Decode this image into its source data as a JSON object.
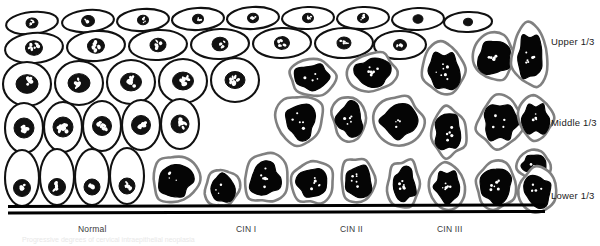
{
  "figure": {
    "width": 600,
    "height": 246,
    "background": "#ffffff"
  },
  "zone_labels": [
    {
      "name": "upper-third",
      "text": "Upper 1/3",
      "x": 551,
      "y": 36
    },
    {
      "name": "middle-third",
      "text": "Middle 1/3",
      "x": 551,
      "y": 117
    },
    {
      "name": "lower-third",
      "text": "Lower 1/3",
      "x": 551,
      "y": 190
    }
  ],
  "stage_labels": [
    {
      "name": "stage-normal",
      "text": "Normal",
      "x": 78,
      "y": 224
    },
    {
      "name": "stage-cin-1",
      "text": "CIN I",
      "x": 236,
      "y": 224
    },
    {
      "name": "stage-cin-2",
      "text": "CIN II",
      "x": 340,
      "y": 224
    },
    {
      "name": "stage-cin-3",
      "text": "CIN III",
      "x": 437,
      "y": 224
    }
  ],
  "caption": {
    "text": "Progressive degrees of cervical intraepithelial neoplasia",
    "visible": "faint"
  },
  "colors": {
    "outline_normal": "#111111",
    "outline_abnormal": "#808080",
    "nucleus_normal": "#111111",
    "nucleus_abnormal": "#050505",
    "cytoplasm": "#ffffff",
    "basement_membrane": "#000000",
    "label_text": "#1b1b1b",
    "stage_text": "#3a3a3a"
  },
  "basement_membrane": {
    "name": "basement-membrane",
    "lines": [
      {
        "x1": 8,
        "y1": 206.5,
        "x2": 545,
        "y2": 205.0,
        "width": 3.0
      },
      {
        "x1": 8,
        "y1": 213.0,
        "x2": 545,
        "y2": 211.5,
        "width": 3.0
      }
    ]
  },
  "chart_data": {
    "type": "diagram",
    "x_progression": [
      "Normal",
      "CIN I",
      "CIN II",
      "CIN III"
    ],
    "y_zones": [
      "Upper 1/3",
      "Middle 1/3",
      "Lower 1/3"
    ],
    "dysplasia_involvement": [
      {
        "stage": "Normal",
        "lower_third": "normal",
        "middle_third": "normal",
        "upper_third": "normal"
      },
      {
        "stage": "CIN I",
        "lower_third": "abnormal",
        "middle_third": "normal",
        "upper_third": "normal"
      },
      {
        "stage": "CIN II",
        "lower_third": "abnormal",
        "middle_third": "abnormal",
        "upper_third": "normal"
      },
      {
        "stage": "CIN III",
        "lower_third": "abnormal",
        "middle_third": "abnormal",
        "upper_third": "abnormal"
      }
    ]
  },
  "normal_cells": {
    "row_top": [
      {
        "cx": 32,
        "cy": 23,
        "rx": 26,
        "ry": 11,
        "nx": 32,
        "ny": 23,
        "nr": 6.0,
        "rot": -6
      },
      {
        "cx": 88,
        "cy": 21,
        "rx": 26,
        "ry": 11,
        "nx": 88,
        "ny": 21,
        "nr": 6.5,
        "rot": -5
      },
      {
        "cx": 143,
        "cy": 20,
        "rx": 26,
        "ry": 11,
        "nx": 143,
        "ny": 20,
        "nr": 5.5,
        "rot": -4
      },
      {
        "cx": 198,
        "cy": 19,
        "rx": 26,
        "ry": 11,
        "nx": 198,
        "ny": 19,
        "nr": 5.5,
        "rot": -3
      },
      {
        "cx": 253,
        "cy": 18,
        "rx": 26,
        "ry": 11,
        "nx": 253,
        "ny": 18,
        "nr": 5.5,
        "rot": -3
      },
      {
        "cx": 308,
        "cy": 18,
        "rx": 26,
        "ry": 11,
        "nx": 308,
        "ny": 18,
        "nr": 5.5,
        "rot": -2
      },
      {
        "cx": 363,
        "cy": 18,
        "rx": 26,
        "ry": 11,
        "nx": 363,
        "ny": 18,
        "nr": 5.5,
        "rot": -2
      },
      {
        "cx": 418,
        "cy": 19,
        "rx": 26,
        "ry": 11,
        "nx": 418,
        "ny": 19,
        "nr": 5.0,
        "rot": -2
      },
      {
        "cx": 468,
        "cy": 22,
        "rx": 24,
        "ry": 10,
        "nx": 468,
        "ny": 22,
        "nr": 4.5,
        "rot": -2
      }
    ],
    "row_second": [
      {
        "cx": 34,
        "cy": 48,
        "rx": 29,
        "ry": 15,
        "nx": 34,
        "ny": 48,
        "nr": 8.5,
        "rot": -5
      },
      {
        "cx": 96,
        "cy": 46,
        "rx": 29,
        "ry": 15,
        "nx": 96,
        "ny": 46,
        "nr": 8.5,
        "rot": -4
      },
      {
        "cx": 158,
        "cy": 45,
        "rx": 29,
        "ry": 15,
        "nx": 158,
        "ny": 45,
        "nr": 8.0,
        "rot": -3
      },
      {
        "cx": 220,
        "cy": 44,
        "rx": 29,
        "ry": 15,
        "nx": 220,
        "ny": 44,
        "nr": 8.0,
        "rot": -2
      },
      {
        "cx": 282,
        "cy": 43,
        "rx": 29,
        "ry": 15,
        "nx": 282,
        "ny": 43,
        "nr": 7.5,
        "rot": -2
      },
      {
        "cx": 344,
        "cy": 43,
        "rx": 29,
        "ry": 15,
        "nx": 344,
        "ny": 43,
        "nr": 7.0,
        "rot": -1
      },
      {
        "cx": 400,
        "cy": 45,
        "rx": 26,
        "ry": 14,
        "nx": 400,
        "ny": 45,
        "nr": 6.5,
        "rot": -1
      }
    ],
    "row_third": [
      {
        "cx": 27,
        "cy": 84,
        "rx": 24,
        "ry": 22,
        "nx": 27,
        "ny": 84,
        "nr": 11.0,
        "rot": 0
      },
      {
        "cx": 79,
        "cy": 83,
        "rx": 24,
        "ry": 22,
        "nx": 79,
        "ny": 83,
        "nr": 11.0,
        "rot": 0
      },
      {
        "cx": 131,
        "cy": 82,
        "rx": 24,
        "ry": 22,
        "nx": 131,
        "ny": 82,
        "nr": 10.5,
        "rot": 0
      },
      {
        "cx": 183,
        "cy": 81,
        "rx": 24,
        "ry": 22,
        "nx": 183,
        "ny": 81,
        "nr": 10.5,
        "rot": 0
      },
      {
        "cx": 235,
        "cy": 80,
        "rx": 24,
        "ry": 22,
        "nx": 235,
        "ny": 80,
        "nr": 10.0,
        "rot": 0
      }
    ],
    "row_fourth": [
      {
        "cx": 24,
        "cy": 128,
        "rx": 19,
        "ry": 25,
        "nx": 24,
        "ny": 128,
        "nr": 10.0,
        "rot": 0
      },
      {
        "cx": 63,
        "cy": 127,
        "rx": 19,
        "ry": 25,
        "nx": 63,
        "ny": 127,
        "nr": 10.0,
        "rot": 0
      },
      {
        "cx": 102,
        "cy": 126,
        "rx": 19,
        "ry": 25,
        "nx": 102,
        "ny": 126,
        "nr": 9.5,
        "rot": 0
      },
      {
        "cx": 141,
        "cy": 125,
        "rx": 19,
        "ry": 25,
        "nx": 141,
        "ny": 125,
        "nr": 9.5,
        "rot": 0
      },
      {
        "cx": 180,
        "cy": 124,
        "rx": 19,
        "ry": 25,
        "nx": 180,
        "ny": 124,
        "nr": 9.0,
        "rot": 0
      }
    ],
    "row_basal": [
      {
        "cx": 22,
        "cy": 178,
        "rx": 17,
        "ry": 28,
        "nx": 22,
        "ny": 188,
        "nr": 8.5,
        "rot": 0
      },
      {
        "cx": 57,
        "cy": 177,
        "rx": 17,
        "ry": 28,
        "nx": 57,
        "ny": 187,
        "nr": 8.5,
        "rot": 0
      },
      {
        "cx": 92,
        "cy": 177,
        "rx": 17,
        "ry": 28,
        "nx": 92,
        "ny": 187,
        "nr": 8.0,
        "rot": 0
      },
      {
        "cx": 127,
        "cy": 176,
        "rx": 17,
        "ry": 28,
        "nx": 127,
        "ny": 186,
        "nr": 8.0,
        "rot": 0
      }
    ]
  },
  "abnormal_cells": {
    "cin1_lower": [
      {
        "name": "dysplastic-cell",
        "cx": 175,
        "cy": 180,
        "w": 46,
        "h": 48,
        "seed": 11
      },
      {
        "name": "dysplastic-cell",
        "cx": 222,
        "cy": 188,
        "w": 34,
        "h": 38,
        "seed": 12
      },
      {
        "name": "dysplastic-cell",
        "cx": 265,
        "cy": 178,
        "w": 44,
        "h": 50,
        "seed": 13
      },
      {
        "name": "dysplastic-cell",
        "cx": 313,
        "cy": 182,
        "w": 40,
        "h": 44,
        "seed": 14
      }
    ],
    "cin2_mid": [
      {
        "name": "dysplastic-cell",
        "cx": 300,
        "cy": 120,
        "w": 46,
        "h": 50,
        "seed": 21
      },
      {
        "name": "dysplastic-cell",
        "cx": 350,
        "cy": 118,
        "w": 36,
        "h": 46,
        "seed": 22
      },
      {
        "name": "dysplastic-cell",
        "cx": 398,
        "cy": 120,
        "w": 48,
        "h": 50,
        "seed": 23
      },
      {
        "name": "dysplastic-cell",
        "cx": 312,
        "cy": 76,
        "w": 46,
        "h": 38,
        "seed": 24
      },
      {
        "name": "dysplastic-cell",
        "cx": 372,
        "cy": 72,
        "w": 50,
        "h": 40,
        "seed": 25
      },
      {
        "name": "dysplastic-cell",
        "cx": 358,
        "cy": 180,
        "w": 36,
        "h": 46,
        "seed": 26
      },
      {
        "name": "dysplastic-cell",
        "cx": 404,
        "cy": 184,
        "w": 34,
        "h": 48,
        "seed": 27
      }
    ],
    "cin3_full": [
      {
        "name": "dysplastic-cell",
        "cx": 444,
        "cy": 70,
        "w": 42,
        "h": 52,
        "seed": 31
      },
      {
        "name": "dysplastic-cell",
        "cx": 494,
        "cy": 58,
        "w": 44,
        "h": 46,
        "seed": 32
      },
      {
        "name": "dysplastic-cell",
        "cx": 530,
        "cy": 56,
        "w": 36,
        "h": 62,
        "seed": 33
      },
      {
        "name": "dysplastic-cell",
        "cx": 449,
        "cy": 132,
        "w": 38,
        "h": 48,
        "seed": 34
      },
      {
        "name": "dysplastic-cell",
        "cx": 500,
        "cy": 122,
        "w": 46,
        "h": 50,
        "seed": 35
      },
      {
        "name": "dysplastic-cell",
        "cx": 536,
        "cy": 118,
        "w": 34,
        "h": 42,
        "seed": 36
      },
      {
        "name": "dysplastic-cell",
        "cx": 534,
        "cy": 165,
        "w": 32,
        "h": 28,
        "seed": 37
      },
      {
        "name": "dysplastic-cell",
        "cx": 447,
        "cy": 186,
        "w": 36,
        "h": 44,
        "seed": 38
      },
      {
        "name": "dysplastic-cell",
        "cx": 496,
        "cy": 186,
        "w": 42,
        "h": 46,
        "seed": 39
      },
      {
        "name": "dysplastic-cell",
        "cx": 538,
        "cy": 190,
        "w": 40,
        "h": 44,
        "seed": 40
      }
    ]
  }
}
